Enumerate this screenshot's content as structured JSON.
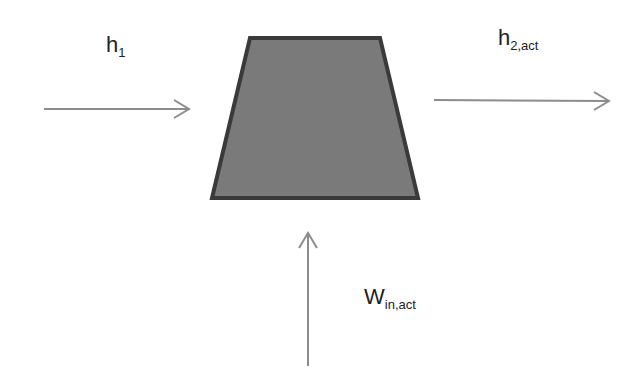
{
  "diagram": {
    "type": "turbine/compressor energy balance schematic",
    "colors": {
      "background": "#ffffff",
      "shape_fill": "#7a7a7a",
      "shape_stroke": "#3a3a3a",
      "arrow": "#8c8c8c",
      "text": "#222222"
    },
    "device": {
      "shape": "trapezoid",
      "points": "250,38 380,38 418,198 212,198"
    },
    "inlet": {
      "label_main": "h",
      "label_sub": "1",
      "arrow": {
        "x1": 44,
        "y1": 109,
        "x2": 189,
        "y2": 109
      }
    },
    "outlet": {
      "label_main": "h",
      "label_sub": "2,act",
      "arrow": {
        "x1": 434,
        "y1": 100,
        "x2": 609,
        "y2": 101
      }
    },
    "work_in": {
      "label_main": "W",
      "label_sub": "in,act",
      "arrow": {
        "x1": 308,
        "y1": 366,
        "x2": 308,
        "y2": 233
      }
    }
  }
}
